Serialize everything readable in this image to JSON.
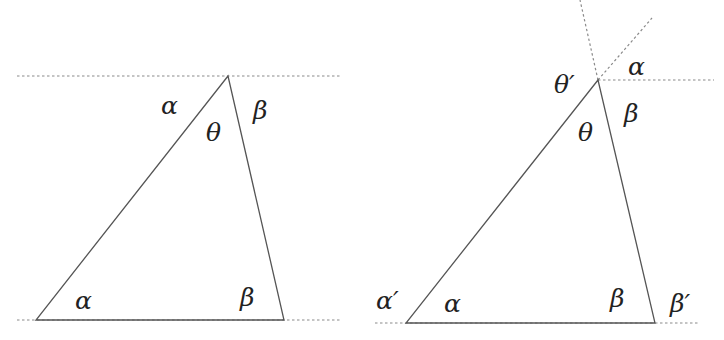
{
  "colors": {
    "line": "#555555",
    "dotted": "#8a8a8a",
    "text": "#222222",
    "background": "#ffffff"
  },
  "left_diagram": {
    "labels": {
      "alpha_top": "α",
      "theta_apex": "θ",
      "beta_top": "β",
      "alpha_bottom": "α",
      "beta_bottom": "β"
    }
  },
  "right_diagram": {
    "labels": {
      "theta_prime": "θ′",
      "alpha_top": "α",
      "theta_apex": "θ",
      "beta_top": "β",
      "alpha_prime": "α′",
      "alpha_bottom": "α",
      "beta_bottom": "β",
      "beta_prime": "β′"
    }
  }
}
